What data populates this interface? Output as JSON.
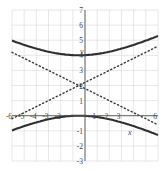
{
  "chart_data": {
    "type": "line",
    "title": "",
    "xlabel": "x",
    "ylabel": "y",
    "xlim": [
      -6,
      6
    ],
    "ylim": [
      -3,
      7
    ],
    "grid": true,
    "x_ticks": [
      -6,
      -5,
      -4,
      -3,
      -2,
      1,
      2,
      3,
      6
    ],
    "y_ticks": [
      -3,
      -2,
      -1,
      1,
      2,
      3,
      4,
      5,
      6,
      7
    ],
    "x_tick_labels": [
      "-6",
      "-5",
      "-4",
      "-3",
      "-2",
      "1",
      "2",
      "3",
      "6"
    ],
    "y_tick_labels": [
      "-3",
      "-2",
      "-1",
      "1",
      "2",
      "3",
      "4",
      "5",
      "6",
      "7"
    ],
    "series": [
      {
        "name": "hyperbola upper branch",
        "style": "solid",
        "equation": "(y-2)^2/4 - (x+0.5)^2/25 = 1",
        "x": [
          -6,
          -5,
          -4,
          -3,
          -2,
          -1,
          -0.5,
          0,
          1,
          2,
          3,
          4,
          5,
          6
        ],
        "values": [
          5.28,
          5.01,
          4.76,
          4.53,
          4.35,
          4.02,
          4.0,
          4.01,
          4.09,
          4.24,
          4.44,
          4.69,
          4.97,
          5.28
        ]
      },
      {
        "name": "hyperbola lower branch",
        "style": "solid",
        "equation": "(y-2)^2/4 - (x+0.5)^2/25 = 1",
        "x": [
          -6,
          -5,
          -4,
          -3,
          -2,
          -1,
          -0.5,
          0,
          1,
          2,
          3,
          4,
          5,
          6
        ],
        "values": [
          -1.28,
          -1.01,
          -0.76,
          -0.53,
          -0.35,
          -0.02,
          0.0,
          -0.01,
          -0.09,
          -0.24,
          -0.44,
          -0.69,
          -0.97,
          -1.28
        ]
      },
      {
        "name": "asymptote rising",
        "style": "dotted",
        "equation": "y = 2 + 0.4(x+0.5)",
        "x": [
          -6,
          6
        ],
        "values": [
          -0.2,
          4.6
        ]
      },
      {
        "name": "asymptote falling",
        "style": "dotted",
        "equation": "y = 2 - 0.4(x+0.5)",
        "x": [
          -6,
          6
        ],
        "values": [
          4.2,
          -0.6
        ]
      }
    ],
    "legend": null
  },
  "labels": {
    "x_axis": "x",
    "y_axis": "y"
  }
}
